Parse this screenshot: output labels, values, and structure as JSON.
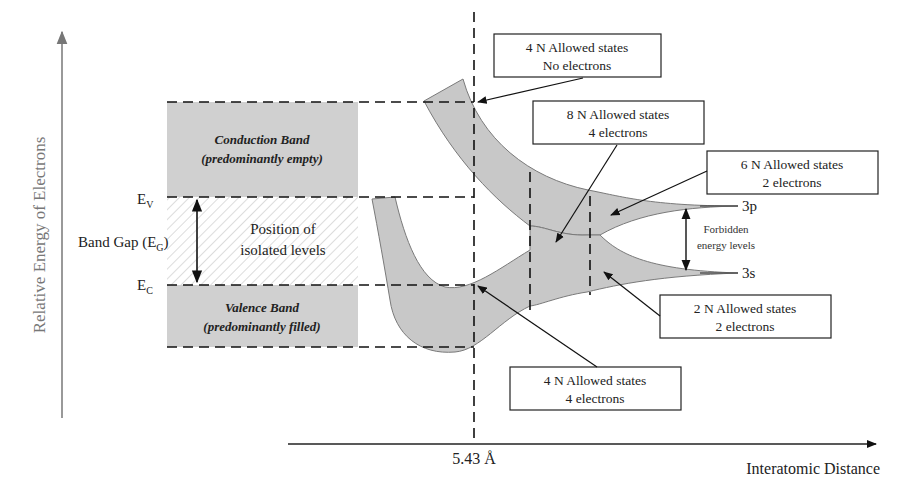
{
  "diagram": {
    "type": "energy-band-formation",
    "y_axis": {
      "label": "Relative Energy of Electrons"
    },
    "x_axis": {
      "label": "Interatomic Distance",
      "marker": "5.43 Å"
    },
    "left_panel": {
      "conduction_band": {
        "title": "Conduction Band",
        "subtitle": "(predominantly empty)"
      },
      "valence_band": {
        "title": "Valence Band",
        "subtitle": "(predominantly filled)"
      },
      "gap_region": {
        "line1": "Position of",
        "line2": "isolated levels"
      },
      "ev_label": {
        "main": "E",
        "sub": "V"
      },
      "ec_label": {
        "main": "E",
        "sub": "C"
      },
      "band_gap": {
        "prefix": "Band Gap (E",
        "sub": "G",
        "suffix": ")"
      }
    },
    "levels": {
      "upper": "3p",
      "lower": "3s",
      "forbidden": {
        "line1": "Forbidden",
        "line2": "energy levels"
      }
    },
    "callouts": [
      {
        "id": "top-conduction",
        "line1": "4 N Allowed states",
        "line2": "No electrons"
      },
      {
        "id": "mixed",
        "line1": "8 N Allowed states",
        "line2": "4 electrons"
      },
      {
        "id": "3p-band",
        "line1": "6 N Allowed states",
        "line2": "2 electrons"
      },
      {
        "id": "3s-band",
        "line1": "2 N Allowed states",
        "line2": "2 electrons"
      },
      {
        "id": "valence",
        "line1": "4 N Allowed states",
        "line2": "4 electrons"
      }
    ],
    "colors": {
      "band_fill": "#c8c8c8",
      "band_stroke": "#7a7a7a",
      "box_fill": "#d0d0d0",
      "axis": "#777777",
      "line": "#222222"
    }
  }
}
